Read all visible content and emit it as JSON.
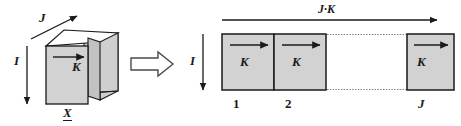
{
  "figure": {
    "colors": {
      "slab_fill": "#d2d2d2",
      "slab_fill_dark": "#c4c4c4",
      "slab_fill_light": "#dcdcdc",
      "stroke": "#1a1a1a",
      "background": "#ffffff"
    }
  },
  "left_diagram": {
    "name": "3d-slab-block",
    "labels": {
      "depth_axis": "J",
      "vertical_axis": "I",
      "slab_width": "K",
      "origin_vector": "X"
    }
  },
  "implies_arrow": {
    "name": "implies-arrow",
    "symbol": "⇒"
  },
  "right_diagram": {
    "name": "slab-sequence",
    "labels": {
      "total_width": "J·K",
      "vertical_axis": "I"
    },
    "slabs": [
      {
        "index_label": "1",
        "width_label": "K"
      },
      {
        "index_label": "2",
        "width_label": "K"
      },
      {
        "index_label": "J",
        "width_label": "K"
      }
    ]
  }
}
